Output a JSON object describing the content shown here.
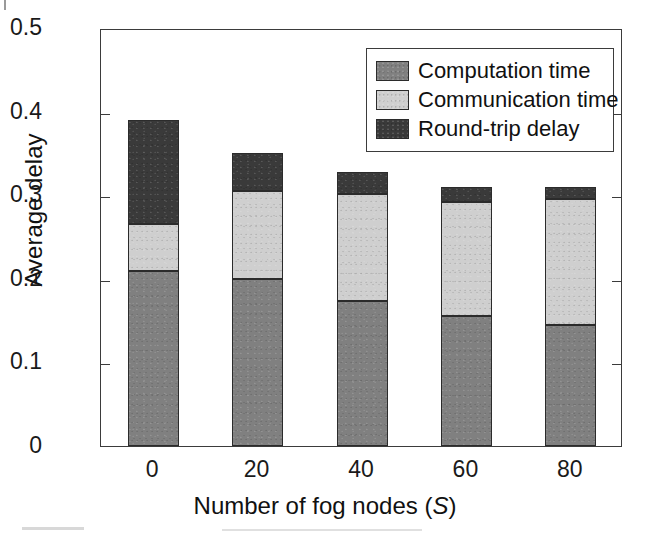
{
  "chart_data": {
    "type": "bar",
    "stacked": true,
    "title": "",
    "xlabel": "Number of fog nodes (S)",
    "xlabel_symbol": "S",
    "ylabel": "Average delay",
    "categories": [
      "0",
      "20",
      "40",
      "60",
      "80"
    ],
    "x": [
      0,
      20,
      40,
      60,
      80
    ],
    "xlim": [
      -10,
      90
    ],
    "ylim": [
      0,
      0.5
    ],
    "ytick_labels": [
      "0",
      "0.1",
      "0.2",
      "0.3",
      "0.4",
      "0.5"
    ],
    "ytick_values": [
      0,
      0.1,
      0.2,
      0.3,
      0.4,
      0.5
    ],
    "xtick_labels": [
      "0",
      "20",
      "40",
      "60",
      "80"
    ],
    "grid": false,
    "legend_position": "top-right",
    "series": [
      {
        "name": "Computation time",
        "color": "#808080",
        "values": [
          0.209,
          0.2,
          0.173,
          0.155,
          0.145
        ]
      },
      {
        "name": "Communication time",
        "color": "#cfcfcf",
        "values": [
          0.056,
          0.105,
          0.129,
          0.137,
          0.151
        ]
      },
      {
        "name": "Round-trip delay",
        "color": "#3a3a3a",
        "values": [
          0.125,
          0.045,
          0.026,
          0.018,
          0.014
        ]
      }
    ],
    "cumulative_tops": [
      [
        0.209,
        0.265,
        0.39
      ],
      [
        0.2,
        0.305,
        0.35
      ],
      [
        0.173,
        0.302,
        0.328
      ],
      [
        0.155,
        0.292,
        0.31
      ],
      [
        0.145,
        0.296,
        0.31
      ]
    ],
    "totals": [
      0.39,
      0.35,
      0.328,
      0.31,
      0.31
    ]
  },
  "legend": {
    "items": [
      {
        "label": "Computation time",
        "color": "#808080"
      },
      {
        "label": "Communication time",
        "color": "#cfcfcf"
      },
      {
        "label": "Round-trip delay",
        "color": "#3a3a3a"
      }
    ]
  },
  "axes": {
    "y_title": "Average delay",
    "x_title_prefix": "Number of fog nodes (",
    "x_title_symbol": "S",
    "x_title_suffix": ")"
  },
  "colors": {
    "axis": "#3b3b3b",
    "text": "#111111",
    "background": "#ffffff"
  }
}
